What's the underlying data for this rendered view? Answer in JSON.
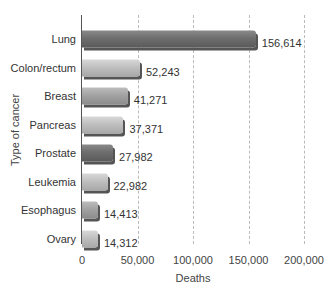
{
  "chart_data": {
    "type": "bar",
    "orientation": "horizontal",
    "title": "",
    "xlabel": "Deaths",
    "ylabel": "Type of cancer",
    "xlim": [
      0,
      200000
    ],
    "xticks": [
      "0",
      "50,000",
      "100,000",
      "150,000",
      "200,000"
    ],
    "grid": "vertical dashed",
    "legend": "none",
    "categories": [
      "Lung",
      "Colon/rectum",
      "Breast",
      "Pancreas",
      "Prostate",
      "Leukemia",
      "Esophagus",
      "Ovary"
    ],
    "values": [
      156614,
      52243,
      41271,
      37371,
      27982,
      22982,
      14413,
      14312
    ],
    "value_labels": [
      "156,614",
      "52,243",
      "41,271",
      "37,371",
      "27,982",
      "22,982",
      "14,413",
      "14,312"
    ],
    "bar_shades": [
      "dark",
      "light",
      "mid",
      "light",
      "dark",
      "light",
      "mid",
      "light"
    ]
  },
  "colors": {
    "dark_bar": "#6e6e6e",
    "light_bar": "#bdbdbd",
    "mid_bar": "#a0a0a0",
    "grid": "#bbbbbb",
    "text": "#333333"
  }
}
